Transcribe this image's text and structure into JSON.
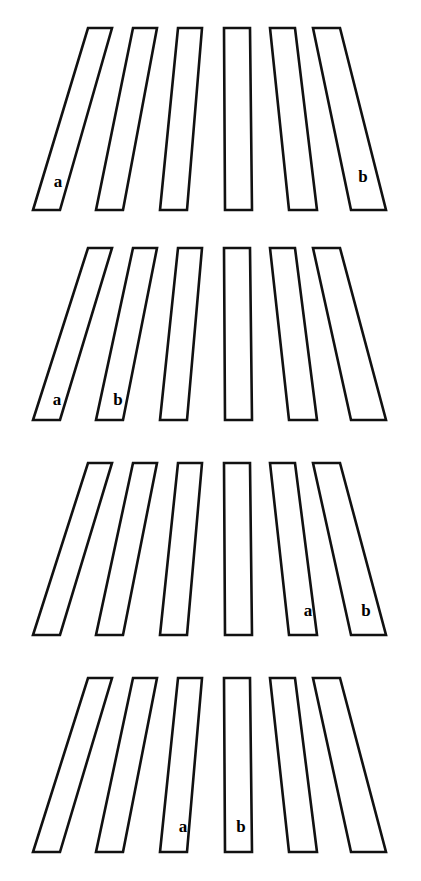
{
  "figure": {
    "type": "line-drawing",
    "background_color": "#ffffff",
    "stroke_color": "#111111",
    "fill_color": "#ffffff",
    "label_color": "#000000",
    "canvas": {
      "width": 421,
      "height": 881
    },
    "panel_count": 4,
    "bars_per_panel": 6,
    "labels_used": [
      "a",
      "b"
    ]
  },
  "panels": [
    {
      "id": "panel-1",
      "index": 1,
      "top": 20,
      "height": 200,
      "labeled_bar_indices": [
        1,
        6
      ],
      "labels": [
        {
          "text": "a",
          "bar_index": 1,
          "x": 58,
          "y": 163
        },
        {
          "text": "b",
          "bar_index": 6,
          "x": 363,
          "y": 158
        }
      ],
      "bars": [
        {
          "index": 1,
          "label": "a",
          "top_left": 88,
          "top_right": 112,
          "bottom_left": 33,
          "bottom_right": 60
        },
        {
          "index": 2,
          "label": "",
          "top_left": 133,
          "top_right": 157,
          "bottom_left": 96,
          "bottom_right": 123
        },
        {
          "index": 3,
          "label": "",
          "top_left": 178,
          "top_right": 202,
          "bottom_left": 160,
          "bottom_right": 187
        },
        {
          "index": 4,
          "label": "",
          "top_left": 224,
          "top_right": 250,
          "bottom_left": 225,
          "bottom_right": 252
        },
        {
          "index": 5,
          "label": "",
          "top_left": 270,
          "top_right": 295,
          "bottom_left": 289,
          "bottom_right": 317
        },
        {
          "index": 6,
          "label": "b",
          "top_left": 313,
          "top_right": 340,
          "bottom_left": 351,
          "bottom_right": 386
        }
      ]
    },
    {
      "id": "panel-2",
      "index": 2,
      "top": 240,
      "height": 190,
      "labeled_bar_indices": [
        1,
        2
      ],
      "labels": [
        {
          "text": "a",
          "bar_index": 1,
          "x": 57,
          "y": 161
        },
        {
          "text": "b",
          "bar_index": 2,
          "x": 118,
          "y": 161
        }
      ],
      "bars": [
        {
          "index": 1,
          "label": "a",
          "top_left": 88,
          "top_right": 112,
          "bottom_left": 33,
          "bottom_right": 60
        },
        {
          "index": 2,
          "label": "b",
          "top_left": 133,
          "top_right": 157,
          "bottom_left": 96,
          "bottom_right": 123
        },
        {
          "index": 3,
          "label": "",
          "top_left": 178,
          "top_right": 202,
          "bottom_left": 160,
          "bottom_right": 187
        },
        {
          "index": 4,
          "label": "",
          "top_left": 224,
          "top_right": 250,
          "bottom_left": 225,
          "bottom_right": 252
        },
        {
          "index": 5,
          "label": "",
          "top_left": 270,
          "top_right": 295,
          "bottom_left": 289,
          "bottom_right": 317
        },
        {
          "index": 6,
          "label": "",
          "top_left": 313,
          "top_right": 340,
          "bottom_left": 351,
          "bottom_right": 386
        }
      ]
    },
    {
      "id": "panel-3",
      "index": 3,
      "top": 455,
      "height": 190,
      "labeled_bar_indices": [
        5,
        6
      ],
      "labels": [
        {
          "text": "a",
          "bar_index": 5,
          "x": 308,
          "y": 157
        },
        {
          "text": "b",
          "bar_index": 6,
          "x": 366,
          "y": 157
        }
      ],
      "bars": [
        {
          "index": 1,
          "label": "",
          "top_left": 88,
          "top_right": 112,
          "bottom_left": 33,
          "bottom_right": 60
        },
        {
          "index": 2,
          "label": "",
          "top_left": 133,
          "top_right": 157,
          "bottom_left": 96,
          "bottom_right": 123
        },
        {
          "index": 3,
          "label": "",
          "top_left": 178,
          "top_right": 202,
          "bottom_left": 160,
          "bottom_right": 187
        },
        {
          "index": 4,
          "label": "",
          "top_left": 224,
          "top_right": 250,
          "bottom_left": 225,
          "bottom_right": 252
        },
        {
          "index": 5,
          "label": "a",
          "top_left": 270,
          "top_right": 295,
          "bottom_left": 289,
          "bottom_right": 317
        },
        {
          "index": 6,
          "label": "b",
          "top_left": 313,
          "top_right": 340,
          "bottom_left": 351,
          "bottom_right": 386
        }
      ]
    },
    {
      "id": "panel-4",
      "index": 4,
      "top": 670,
      "height": 192,
      "labeled_bar_indices": [
        3,
        4
      ],
      "labels": [
        {
          "text": "a",
          "bar_index": 3,
          "x": 183,
          "y": 158
        },
        {
          "text": "b",
          "bar_index": 4,
          "x": 241,
          "y": 158
        }
      ],
      "bars": [
        {
          "index": 1,
          "label": "",
          "top_left": 88,
          "top_right": 112,
          "bottom_left": 33,
          "bottom_right": 60
        },
        {
          "index": 2,
          "label": "",
          "top_left": 133,
          "top_right": 157,
          "bottom_left": 96,
          "bottom_right": 123
        },
        {
          "index": 3,
          "label": "a",
          "top_left": 178,
          "top_right": 202,
          "bottom_left": 160,
          "bottom_right": 187
        },
        {
          "index": 4,
          "label": "b",
          "top_left": 224,
          "top_right": 250,
          "bottom_left": 225,
          "bottom_right": 252
        },
        {
          "index": 5,
          "label": "",
          "top_left": 270,
          "top_right": 295,
          "bottom_left": 289,
          "bottom_right": 317
        },
        {
          "index": 6,
          "label": "",
          "top_left": 313,
          "top_right": 340,
          "bottom_left": 351,
          "bottom_right": 386
        }
      ]
    }
  ]
}
